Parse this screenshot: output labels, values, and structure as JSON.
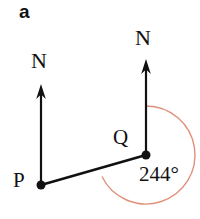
{
  "figure": {
    "part_label": "a",
    "background_color": "#ffffff",
    "stroke_color": "#111111",
    "arc_color": "#e0907a",
    "labels": {
      "north_left": "N",
      "north_right": "N",
      "point_p": "P",
      "point_q": "Q",
      "bearing_value": "244°"
    },
    "geometry": {
      "point_p": {
        "x": 41,
        "y": 185
      },
      "point_q": {
        "x": 146,
        "y": 155
      },
      "north_arrow_left": {
        "x": 41,
        "tip_y": 84,
        "base_y": 185
      },
      "north_arrow_right": {
        "x": 146,
        "tip_y": 59,
        "base_y": 155
      },
      "bearing_arc": {
        "center": {
          "x": 146,
          "y": 155
        },
        "radius": 49,
        "start_angle_deg": 0,
        "sweep_deg": 244
      },
      "segment_pq": {
        "x1": 41,
        "y1": 185,
        "x2": 146,
        "y2": 155
      },
      "dot_radius": 4.5
    }
  }
}
